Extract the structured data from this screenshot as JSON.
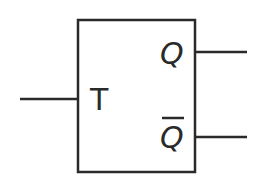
{
  "diagram": {
    "type": "T flip-flop symbol",
    "stroke_color": "#2a2a2a",
    "background": "#ffffff",
    "inputs": [
      {
        "label": "T"
      }
    ],
    "outputs": [
      {
        "label": "Q",
        "overline": false
      },
      {
        "label": "Q",
        "overline": true,
        "meaning": "Q-bar (complement)"
      }
    ]
  }
}
